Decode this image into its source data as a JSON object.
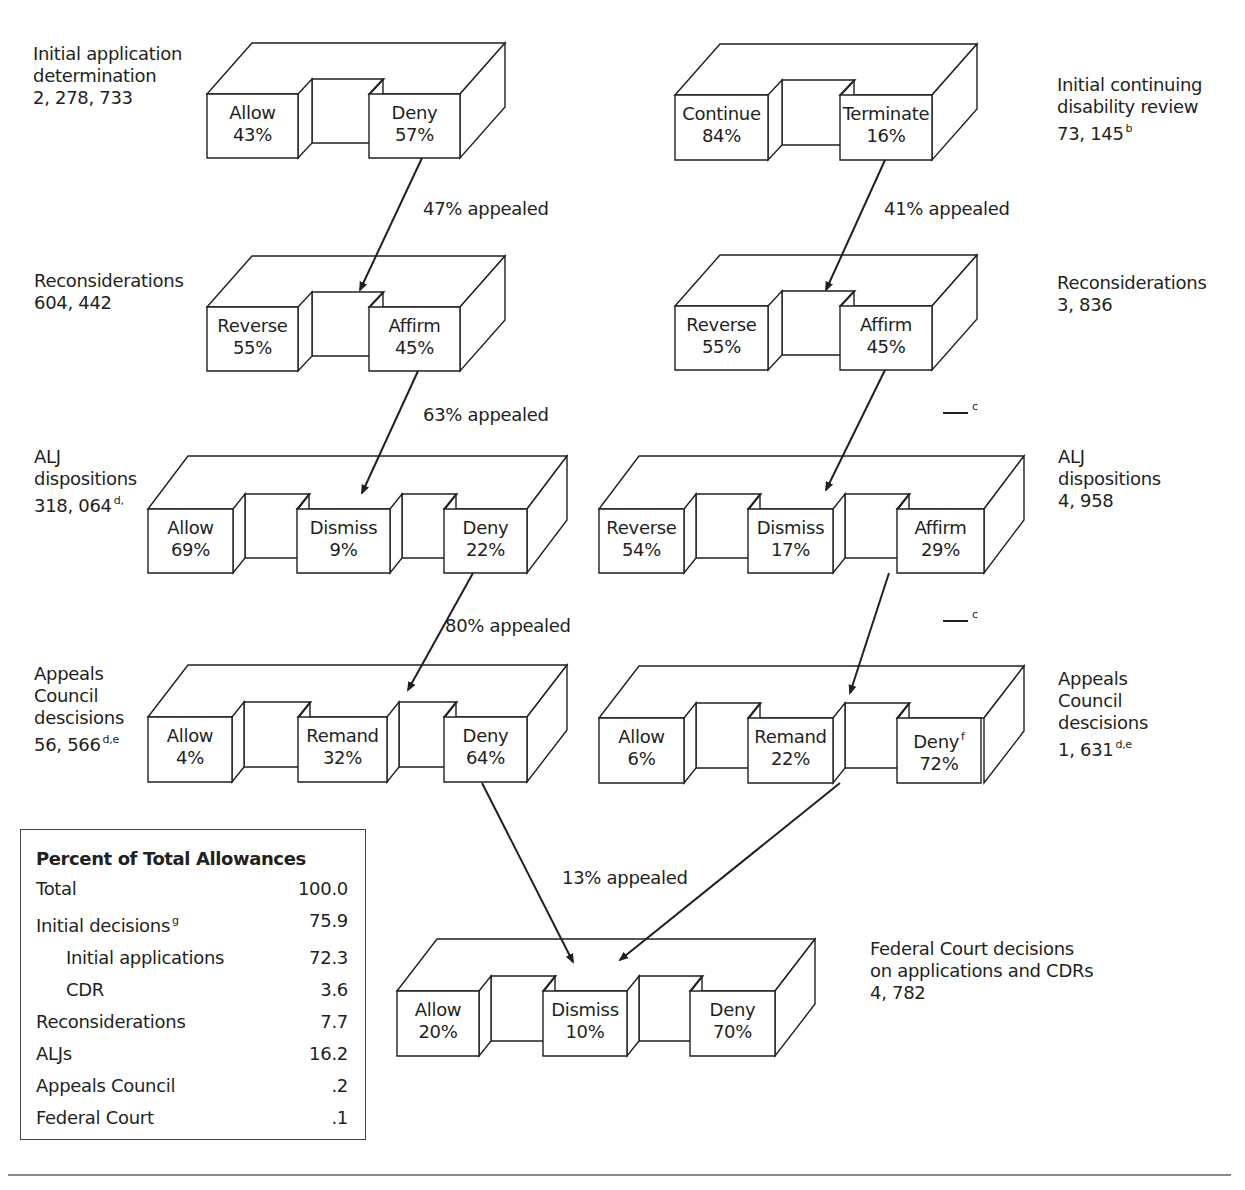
{
  "diagram": {
    "colors": {
      "line": "#231f20",
      "background": "#ffffff",
      "rule": "#888888"
    },
    "boxes": [
      {
        "id": "initial-application",
        "column": "applications",
        "x": 207,
        "y": 94,
        "w": 253,
        "h": 64,
        "dx": 45,
        "dy": -51,
        "nx": 14,
        "ny": -15,
        "faces": [
          {
            "label": "Allow",
            "value": "43%",
            "x0": 207,
            "x1": 298
          },
          {
            "label": "Deny",
            "value": "57%",
            "x0": 369,
            "x1": 460
          }
        ],
        "caption": {
          "lines": [
            "Initial application",
            "determination",
            "2, 278, 733"
          ],
          "sup": "",
          "x": 33,
          "y": 43
        }
      },
      {
        "id": "initial-cdr",
        "column": "cdr",
        "x": 675,
        "y": 95,
        "w": 257,
        "h": 65,
        "dx": 45,
        "dy": -51,
        "nx": 14,
        "ny": -15,
        "faces": [
          {
            "label": "Continue",
            "value": "84%",
            "x0": 675,
            "x1": 768
          },
          {
            "label": "Terminate",
            "value": "16%",
            "x0": 840,
            "x1": 932
          }
        ],
        "caption": {
          "lines": [
            "Initial continuing",
            "disability review",
            "73, 145"
          ],
          "sup": "b",
          "x": 1057,
          "y": 74
        }
      },
      {
        "id": "reconsideration-applications",
        "column": "applications",
        "x": 207,
        "y": 307,
        "w": 253,
        "h": 64,
        "dx": 45,
        "dy": -51,
        "nx": 14,
        "ny": -15,
        "faces": [
          {
            "label": "Reverse",
            "value": "55%",
            "x0": 207,
            "x1": 298
          },
          {
            "label": "Affirm",
            "value": "45%",
            "x0": 369,
            "x1": 460
          }
        ],
        "caption": {
          "lines": [
            "Reconsiderations",
            "604, 442"
          ],
          "sup": "",
          "x": 34,
          "y": 270
        }
      },
      {
        "id": "reconsideration-cdr",
        "column": "cdr",
        "x": 675,
        "y": 306,
        "w": 257,
        "h": 64,
        "dx": 45,
        "dy": -51,
        "nx": 14,
        "ny": -15,
        "faces": [
          {
            "label": "Reverse",
            "value": "55%",
            "x0": 675,
            "x1": 768
          },
          {
            "label": "Affirm",
            "value": "45%",
            "x0": 840,
            "x1": 932
          }
        ],
        "caption": {
          "lines": [
            "Reconsiderations",
            "3, 836"
          ],
          "sup": "",
          "x": 1057,
          "y": 272
        }
      },
      {
        "id": "alj-applications",
        "column": "applications",
        "x": 148,
        "y": 509,
        "w": 379,
        "h": 64,
        "dx": 40,
        "dy": -53,
        "nx": 12,
        "ny": -15,
        "faces": [
          {
            "label": "Allow",
            "value": "69%",
            "x0": 148,
            "x1": 233
          },
          {
            "label": "Dismiss",
            "value": "9%",
            "x0": 297,
            "x1": 390
          },
          {
            "label": "Deny",
            "value": "22%",
            "x0": 444,
            "x1": 527
          }
        ],
        "caption": {
          "lines": [
            "ALJ",
            "dispositions",
            "318, 064"
          ],
          "sup": "d,",
          "x": 34,
          "y": 446
        }
      },
      {
        "id": "alj-cdr",
        "column": "cdr",
        "x": 599,
        "y": 509,
        "w": 385,
        "h": 64,
        "dx": 40,
        "dy": -53,
        "nx": 12,
        "ny": -15,
        "faces": [
          {
            "label": "Reverse",
            "value": "54%",
            "x0": 599,
            "x1": 684
          },
          {
            "label": "Dismiss",
            "value": "17%",
            "x0": 748,
            "x1": 833
          },
          {
            "label": "Affirm",
            "value": "29%",
            "x0": 897,
            "x1": 984
          }
        ],
        "caption": {
          "lines": [
            "ALJ",
            "dispositions",
            "4, 958"
          ],
          "sup": "",
          "x": 1058,
          "y": 446
        }
      },
      {
        "id": "appeals-council-applications",
        "column": "applications",
        "x": 148,
        "y": 717,
        "w": 379,
        "h": 65,
        "dx": 40,
        "dy": -52,
        "nx": 12,
        "ny": -15,
        "faces": [
          {
            "label": "Allow",
            "value": "4%",
            "x0": 148,
            "x1": 232
          },
          {
            "label": "Remand",
            "value": "32%",
            "x0": 298,
            "x1": 387
          },
          {
            "label": "Deny",
            "value": "64%",
            "x0": 444,
            "x1": 527
          }
        ],
        "caption": {
          "lines": [
            "Appeals",
            "Council",
            "descisions",
            "56, 566"
          ],
          "sup": "d,e",
          "x": 34,
          "y": 663
        }
      },
      {
        "id": "appeals-council-cdr",
        "column": "cdr",
        "x": 599,
        "y": 718,
        "w": 385,
        "h": 65,
        "dx": 40,
        "dy": -52,
        "nx": 12,
        "ny": -15,
        "faces": [
          {
            "label": "Allow",
            "value": "6%",
            "x0": 599,
            "x1": 684
          },
          {
            "label": "Remand",
            "value": "22%",
            "x0": 748,
            "x1": 833
          },
          {
            "label": "Deny",
            "value": "72%",
            "x0": 897,
            "x1": 981,
            "sup": "f"
          }
        ],
        "caption": {
          "lines": [
            "Appeals",
            "Council",
            "descisions",
            "1, 631"
          ],
          "sup": "d,e",
          "x": 1058,
          "y": 668
        }
      },
      {
        "id": "federal-court",
        "column": "combined",
        "x": 397,
        "y": 991,
        "w": 378,
        "h": 65,
        "dx": 40,
        "dy": -52,
        "nx": 12,
        "ny": -15,
        "faces": [
          {
            "label": "Allow",
            "value": "20%",
            "x0": 397,
            "x1": 479
          },
          {
            "label": "Dismiss",
            "value": "10%",
            "x0": 543,
            "x1": 627
          },
          {
            "label": "Deny",
            "value": "70%",
            "x0": 690,
            "x1": 775
          }
        ],
        "caption": {
          "lines": [
            "Federal Court decisions",
            "on applications and CDRs",
            "4, 782"
          ],
          "sup": "",
          "x": 870,
          "y": 938
        }
      }
    ],
    "arrows": [
      {
        "from": [
          422,
          158
        ],
        "to": [
          360,
          290
        ],
        "label": "47% appealed",
        "lx": 423,
        "ly": 198
      },
      {
        "from": [
          885,
          160
        ],
        "to": [
          826,
          290
        ],
        "label": "41% appealed",
        "lx": 884,
        "ly": 198
      },
      {
        "from": [
          418,
          371
        ],
        "to": [
          362,
          493
        ],
        "label": "63% appealed",
        "lx": 423,
        "ly": 404
      },
      {
        "from": [
          885,
          370
        ],
        "to": [
          826,
          490
        ],
        "label": "",
        "lx": 0,
        "ly": 0
      },
      {
        "from": [
          473,
          573
        ],
        "to": [
          408,
          690
        ],
        "label": "80% appealed",
        "lx": 445,
        "ly": 615
      },
      {
        "from": [
          889,
          573
        ],
        "to": [
          850,
          693
        ],
        "label": "",
        "lx": 0,
        "ly": 0
      },
      {
        "from": [
          482,
          783
        ],
        "to": [
          573,
          962
        ],
        "label": "13% appealed",
        "lx": 562,
        "ly": 867
      },
      {
        "from": [
          840,
          783
        ],
        "to": [
          620,
          960
        ],
        "label": "",
        "lx": 0,
        "ly": 0
      }
    ],
    "footnote_marks": [
      {
        "mark": "c",
        "x": 943,
        "y": 412
      },
      {
        "mark": "c",
        "x": 943,
        "y": 620
      }
    ]
  },
  "summary": {
    "title": "Percent of Total Allowances",
    "rows": [
      {
        "label": "Total",
        "value": "100.0",
        "indent": false,
        "sup": ""
      },
      {
        "label": "Initial decisions",
        "value": "75.9",
        "indent": false,
        "sup": "g"
      },
      {
        "label": "Initial applications",
        "value": "72.3",
        "indent": true,
        "sup": ""
      },
      {
        "label": "CDR",
        "value": "3.6",
        "indent": true,
        "sup": ""
      },
      {
        "label": "Reconsiderations",
        "value": "7.7",
        "indent": false,
        "sup": ""
      },
      {
        "label": "ALJs",
        "value": "16.2",
        "indent": false,
        "sup": ""
      },
      {
        "label": "Appeals Council",
        "value": ".2",
        "indent": false,
        "sup": ""
      },
      {
        "label": "Federal Court",
        "value": ".1",
        "indent": false,
        "sup": ""
      }
    ]
  }
}
